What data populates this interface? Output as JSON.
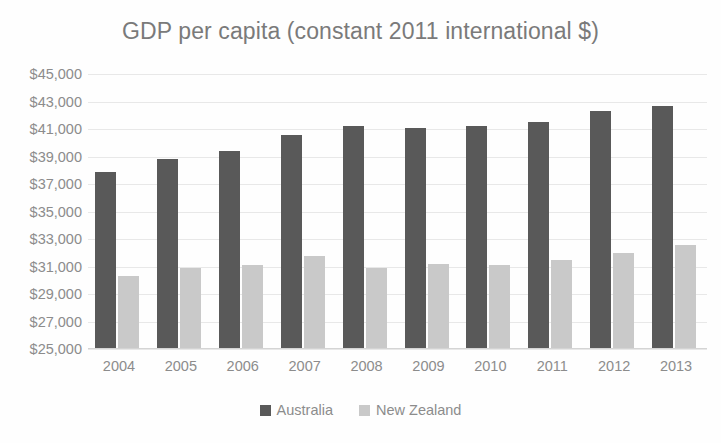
{
  "chart_data": {
    "type": "bar",
    "title": "GDP per capita (constant 2011 international $)",
    "xlabel": "",
    "ylabel": "",
    "categories": [
      "2004",
      "2005",
      "2006",
      "2007",
      "2008",
      "2009",
      "2010",
      "2011",
      "2012",
      "2013"
    ],
    "series": [
      {
        "name": "Australia",
        "color": "#595959",
        "values": [
          37900,
          38800,
          39400,
          40600,
          41200,
          41100,
          41200,
          41500,
          42300,
          42700
        ]
      },
      {
        "name": "New Zealand",
        "color": "#c9c9c9",
        "values": [
          30300,
          30900,
          31100,
          31800,
          30900,
          31200,
          31100,
          31500,
          32000,
          32600
        ]
      }
    ],
    "ylim": [
      25000,
      45000
    ],
    "ytick_step": 2000,
    "ytick_labels": [
      "$45,000",
      "$43,000",
      "$41,000",
      "$39,000",
      "$37,000",
      "$35,000",
      "$33,000",
      "$31,000",
      "$29,000",
      "$27,000",
      "$25,000"
    ],
    "ytick_values": [
      45000,
      43000,
      41000,
      39000,
      37000,
      35000,
      33000,
      31000,
      29000,
      27000,
      25000
    ],
    "grid": true,
    "legend_position": "bottom",
    "legend_entries": [
      "Australia",
      "New Zealand"
    ]
  }
}
